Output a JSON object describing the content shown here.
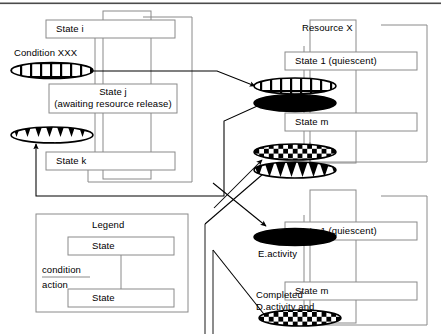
{
  "diagram": {
    "title_resource": "Resource X",
    "groups": {
      "left_process": {
        "states": [
          {
            "id": "state-i",
            "label": "State i"
          },
          {
            "id": "state-j",
            "label": "State j"
          },
          {
            "id": "state-j-sub",
            "label": "(awaiting resource release)"
          },
          {
            "id": "state-k",
            "label": "State k"
          }
        ],
        "condition_label": "Condition XXX"
      },
      "resource_top": {
        "states": [
          {
            "id": "res-top-state1",
            "label": "State 1 (quiescent)"
          },
          {
            "id": "res-top-statem",
            "label": "State m"
          }
        ]
      },
      "resource_bottom": {
        "states": [
          {
            "id": "res-bot-state1",
            "label": "State 1 (quiescent)"
          },
          {
            "id": "res-bot-statem",
            "label": "State m"
          }
        ],
        "activity_label": "E.activity",
        "completed_label_line1": "Completed",
        "completed_label_line2": "D.activity and"
      }
    },
    "transitions": [
      {
        "id": "t-brick-left",
        "pattern": "brick",
        "from": "left-process",
        "to": "resource-top"
      },
      {
        "id": "t-brick-right",
        "pattern": "brick",
        "at": "resource-top"
      },
      {
        "id": "t-solid-top",
        "pattern": "solid",
        "at": "resource-top"
      },
      {
        "id": "t-checker-top",
        "pattern": "checker",
        "at": "resource-top"
      },
      {
        "id": "t-triangle-right",
        "pattern": "triangle",
        "at": "resource-top"
      },
      {
        "id": "t-triangle-left",
        "pattern": "triangle",
        "at": "left-process"
      },
      {
        "id": "t-solid-bottom",
        "pattern": "solid",
        "at": "resource-bottom"
      },
      {
        "id": "t-checker-bottom",
        "pattern": "checker",
        "at": "resource-bottom"
      }
    ]
  },
  "legend": {
    "title": "Legend",
    "state_top_label": "State",
    "state_bottom_label": "State",
    "condition_label": "condition",
    "action_label": "action"
  },
  "colors": {
    "ink": "#000000",
    "box_stroke": "#8a8a8a",
    "fill": "#ffffff",
    "top_rule": "#4a4a4a"
  }
}
